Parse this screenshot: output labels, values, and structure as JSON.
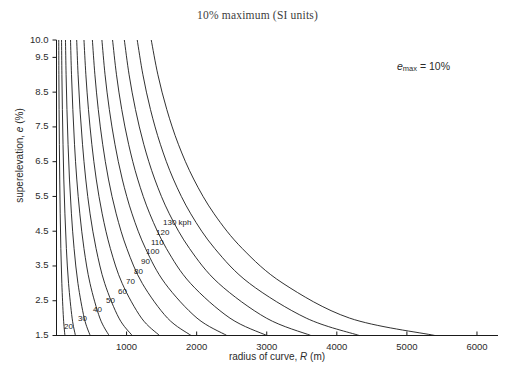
{
  "chart_data": {
    "type": "line",
    "title": "10% maximum (SI units)",
    "xlabel": "radius of curve, R (m)",
    "ylabel": "superelevation, e (%)",
    "annotation": "e_max = 10%",
    "annotation_parts": {
      "symbol": "e",
      "sub": "max",
      "value": "= 10%"
    },
    "xlim": [
      0,
      6300
    ],
    "ylim": [
      1.5,
      10.0
    ],
    "xticks": [
      1000,
      2000,
      3000,
      4000,
      5000,
      6000
    ],
    "xtick_labels": [
      "1000",
      "2000",
      "3000",
      "4000",
      "5000",
      "6000"
    ],
    "yticks": [
      1.5,
      2.5,
      3.5,
      4.5,
      5.5,
      6.5,
      7.5,
      8.5,
      9.5,
      10.0
    ],
    "ytick_labels": [
      "1.5",
      "2.5",
      "3.5",
      "4.5",
      "5.5",
      "6.5",
      "7.5",
      "8.5",
      "9.5",
      "10.0"
    ],
    "grid": false,
    "legend": "inline-curve-labels",
    "series_unit": "kph",
    "series": [
      {
        "name": "20",
        "label": "20",
        "speed": 20,
        "points": [
          [
            32,
            10.0
          ],
          [
            34,
            9.0
          ],
          [
            37,
            8.0
          ],
          [
            41,
            7.0
          ],
          [
            46,
            6.0
          ],
          [
            53,
            5.0
          ],
          [
            62,
            4.0
          ],
          [
            76,
            3.0
          ],
          [
            99,
            2.0
          ],
          [
            120,
            1.5
          ]
        ]
      },
      {
        "name": "30",
        "label": "30",
        "speed": 30,
        "points": [
          [
            72,
            10.0
          ],
          [
            77,
            9.0
          ],
          [
            84,
            8.0
          ],
          [
            93,
            7.0
          ],
          [
            104,
            6.0
          ],
          [
            120,
            5.0
          ],
          [
            141,
            4.0
          ],
          [
            172,
            3.0
          ],
          [
            223,
            2.0
          ],
          [
            270,
            1.5
          ]
        ]
      },
      {
        "name": "40",
        "label": "40",
        "speed": 40,
        "points": [
          [
            128,
            10.0
          ],
          [
            137,
            9.0
          ],
          [
            149,
            8.0
          ],
          [
            165,
            7.0
          ],
          [
            185,
            6.0
          ],
          [
            213,
            5.0
          ],
          [
            251,
            4.0
          ],
          [
            306,
            3.0
          ],
          [
            396,
            2.0
          ],
          [
            480,
            1.5
          ]
        ]
      },
      {
        "name": "50",
        "label": "50",
        "speed": 50,
        "points": [
          [
            200,
            10.0
          ],
          [
            214,
            9.0
          ],
          [
            233,
            8.0
          ],
          [
            257,
            7.0
          ],
          [
            289,
            6.0
          ],
          [
            333,
            5.0
          ],
          [
            392,
            4.0
          ],
          [
            478,
            3.0
          ],
          [
            619,
            2.0
          ],
          [
            750,
            1.5
          ]
        ]
      },
      {
        "name": "60",
        "label": "60",
        "speed": 60,
        "points": [
          [
            288,
            10.0
          ],
          [
            308,
            9.0
          ],
          [
            335,
            8.0
          ],
          [
            371,
            7.0
          ],
          [
            417,
            6.0
          ],
          [
            479,
            5.0
          ],
          [
            565,
            4.0
          ],
          [
            688,
            3.0
          ],
          [
            891,
            2.0
          ],
          [
            1080,
            1.5
          ]
        ]
      },
      {
        "name": "70",
        "label": "70",
        "speed": 70,
        "points": [
          [
            392,
            10.0
          ],
          [
            419,
            9.0
          ],
          [
            456,
            8.0
          ],
          [
            504,
            7.0
          ],
          [
            567,
            6.0
          ],
          [
            652,
            5.0
          ],
          [
            769,
            4.0
          ],
          [
            937,
            3.0
          ],
          [
            1213,
            2.0
          ],
          [
            1470,
            1.5
          ]
        ]
      },
      {
        "name": "80",
        "label": "80",
        "speed": 80,
        "points": [
          [
            512,
            10.0
          ],
          [
            548,
            9.0
          ],
          [
            596,
            8.0
          ],
          [
            659,
            7.0
          ],
          [
            741,
            6.0
          ],
          [
            852,
            5.0
          ],
          [
            1004,
            4.0
          ],
          [
            1224,
            3.0
          ],
          [
            1584,
            2.0
          ],
          [
            1920,
            1.5
          ]
        ]
      },
      {
        "name": "90",
        "label": "90",
        "speed": 90,
        "points": [
          [
            648,
            10.0
          ],
          [
            693,
            9.0
          ],
          [
            754,
            8.0
          ],
          [
            834,
            7.0
          ],
          [
            938,
            6.0
          ],
          [
            1078,
            5.0
          ],
          [
            1271,
            4.0
          ],
          [
            1549,
            3.0
          ],
          [
            2005,
            2.0
          ],
          [
            2430,
            1.5
          ]
        ]
      },
      {
        "name": "100",
        "label": "100",
        "speed": 100,
        "points": [
          [
            800,
            10.0
          ],
          [
            856,
            9.0
          ],
          [
            931,
            8.0
          ],
          [
            1029,
            7.0
          ],
          [
            1158,
            6.0
          ],
          [
            1331,
            5.0
          ],
          [
            1569,
            4.0
          ],
          [
            1912,
            3.0
          ],
          [
            2475,
            2.0
          ],
          [
            3000,
            1.5
          ]
        ]
      },
      {
        "name": "110",
        "label": "110",
        "speed": 110,
        "points": [
          [
            968,
            10.0
          ],
          [
            1036,
            9.0
          ],
          [
            1127,
            8.0
          ],
          [
            1245,
            7.0
          ],
          [
            1401,
            6.0
          ],
          [
            1610,
            5.0
          ],
          [
            1899,
            4.0
          ],
          [
            2314,
            3.0
          ],
          [
            2995,
            2.0
          ],
          [
            3630,
            1.5
          ]
        ]
      },
      {
        "name": "120",
        "label": "120",
        "speed": 120,
        "points": [
          [
            1152,
            10.0
          ],
          [
            1233,
            9.0
          ],
          [
            1341,
            8.0
          ],
          [
            1482,
            7.0
          ],
          [
            1667,
            6.0
          ],
          [
            1916,
            5.0
          ],
          [
            2259,
            4.0
          ],
          [
            2753,
            3.0
          ],
          [
            3564,
            2.0
          ],
          [
            4320,
            1.5
          ]
        ]
      },
      {
        "name": "130 kph",
        "label": "130 kph",
        "speed": 130,
        "points": [
          [
            1352,
            10.0
          ],
          [
            1447,
            9.0
          ],
          [
            1574,
            8.0
          ],
          [
            1739,
            7.0
          ],
          [
            1957,
            6.0
          ],
          [
            2249,
            5.0
          ],
          [
            2652,
            4.0
          ],
          [
            3232,
            3.0
          ],
          [
            4183,
            2.0
          ],
          [
            5400,
            1.5
          ]
        ]
      }
    ],
    "curve_label_positions": [
      {
        "label": "20",
        "x": 64,
        "y": 322
      },
      {
        "label": "30",
        "x": 78,
        "y": 314
      },
      {
        "label": "40",
        "x": 93,
        "y": 305
      },
      {
        "label": "50",
        "x": 106,
        "y": 296
      },
      {
        "label": "60",
        "x": 118,
        "y": 287
      },
      {
        "label": "70",
        "x": 126,
        "y": 277
      },
      {
        "label": "80",
        "x": 134,
        "y": 267
      },
      {
        "label": "90",
        "x": 141,
        "y": 257
      },
      {
        "label": "100",
        "x": 146,
        "y": 247
      },
      {
        "label": "110",
        "x": 151,
        "y": 238
      },
      {
        "label": "120",
        "x": 156,
        "y": 228
      },
      {
        "label": "130 kph",
        "x": 163,
        "y": 218
      }
    ]
  }
}
